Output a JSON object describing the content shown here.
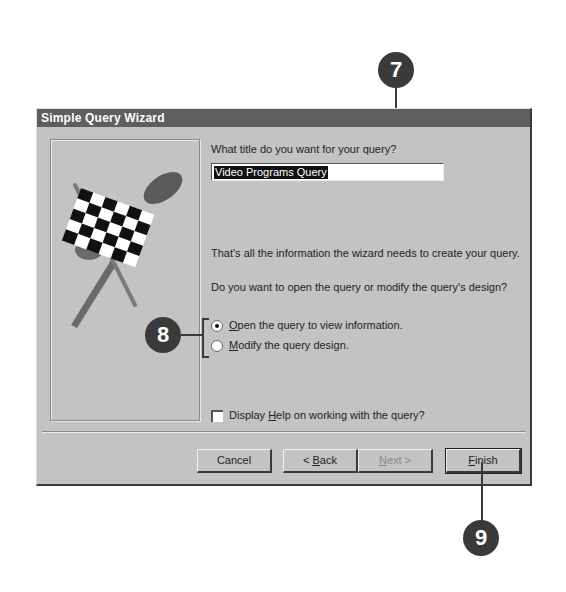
{
  "dialog": {
    "title": "Simple Query Wizard",
    "title_prompt": "What title do you want for your query?",
    "title_value": "Video Programs Query",
    "info_text": "That's all the information the wizard needs to create your query.",
    "question_text": "Do you want to open the query or modify the query's design?",
    "options": [
      {
        "label_access_key": "O",
        "label_rest": "pen the query to view information.",
        "selected": true
      },
      {
        "label_access_key": "M",
        "label_rest": "odify the query design.",
        "selected": false
      }
    ],
    "help_checkbox": {
      "label_pre": "Display ",
      "label_access_key": "H",
      "label_rest": "elp on working with the query?",
      "checked": false
    },
    "buttons": {
      "cancel": "Cancel",
      "back_pre": "< ",
      "back_key": "B",
      "back_rest": "ack",
      "next_key": "N",
      "next_rest": "ext >",
      "finish_key": "F",
      "finish_rest": "inish"
    }
  },
  "callouts": [
    {
      "number": "7"
    },
    {
      "number": "8"
    },
    {
      "number": "9"
    }
  ],
  "illustration": "checkered-flag-icon"
}
